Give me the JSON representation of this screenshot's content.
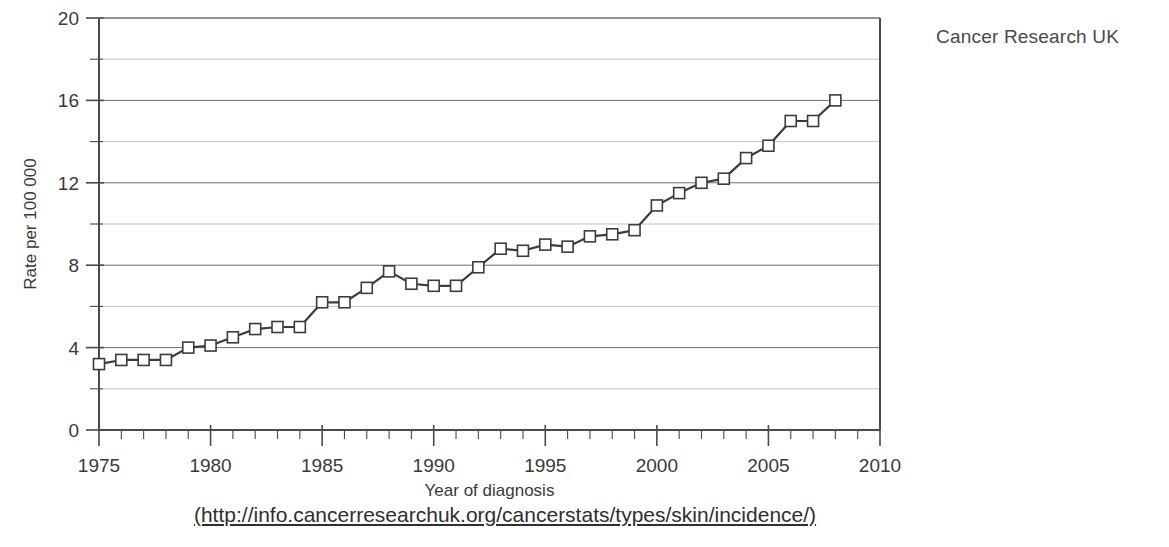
{
  "credit": {
    "label": "Cancer Research UK"
  },
  "source": {
    "url_text": "(http://info.cancerresearchuk.org/cancerstats/types/skin/incidence/)"
  },
  "chart_data": {
    "type": "line",
    "title": "",
    "subtitle": "",
    "xlabel": "Year of diagnosis",
    "ylabel": "Rate per 100 000",
    "xlim": [
      1975,
      2010
    ],
    "ylim": [
      0,
      20
    ],
    "grid": true,
    "legend_position": "none",
    "x_major_ticks": [
      1975,
      1980,
      1985,
      1990,
      1995,
      2000,
      2005,
      2010
    ],
    "x_tick_labels": [
      "1975",
      "1980",
      "1985",
      "1990",
      "1995",
      "2000",
      "2005",
      "2010"
    ],
    "x_minor_tick_step": 1,
    "y_major_ticks": [
      0,
      4,
      8,
      12,
      16,
      20
    ],
    "y_tick_labels": [
      "0",
      "4",
      "8",
      "12",
      "16",
      "20"
    ],
    "y_minor_ticks": [
      2,
      6,
      10,
      14,
      18
    ],
    "marker": "open-square",
    "series": [
      {
        "name": "Malignant melanoma incidence rate",
        "x": [
          1975,
          1976,
          1977,
          1978,
          1979,
          1980,
          1981,
          1982,
          1983,
          1984,
          1985,
          1986,
          1987,
          1988,
          1989,
          1990,
          1991,
          1992,
          1993,
          1994,
          1995,
          1996,
          1997,
          1998,
          1999,
          2000,
          2001,
          2002,
          2003,
          2004,
          2005,
          2006,
          2007,
          2008
        ],
        "values": [
          3.2,
          3.4,
          3.4,
          3.4,
          4.0,
          4.1,
          4.5,
          4.9,
          5.0,
          5.0,
          6.2,
          6.2,
          6.9,
          7.7,
          7.1,
          7.0,
          7.0,
          7.9,
          8.8,
          8.7,
          9.0,
          8.9,
          9.4,
          9.5,
          9.7,
          10.9,
          11.5,
          12.0,
          12.2,
          13.2,
          13.8,
          15.0,
          15.0,
          16.0
        ]
      }
    ]
  }
}
